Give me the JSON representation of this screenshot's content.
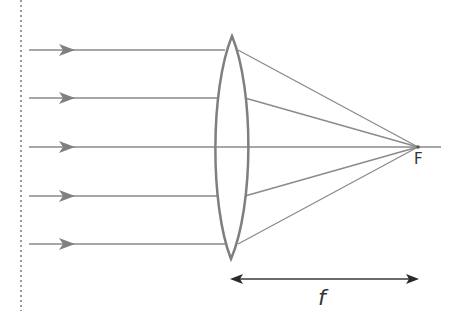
{
  "diagram": {
    "type": "optics-ray-diagram",
    "colors": {
      "ray": "#8a8a8a",
      "lens": "#7f7f7f",
      "arrow": "#3a3a3a",
      "dotted": "#9a9a9a",
      "text": "#333333"
    },
    "labels": {
      "focal_point": "F",
      "focal_length": "f"
    },
    "incoming_rays": [
      {
        "y": 50
      },
      {
        "y": 98
      },
      {
        "y": 147
      },
      {
        "y": 196
      },
      {
        "y": 244
      }
    ],
    "lens": {
      "center_x": 232,
      "top_y": 36,
      "bottom_y": 259,
      "half_width": 15
    },
    "focal_point": {
      "x": 418,
      "y": 147
    },
    "focal_length_arrow": {
      "x1": 231,
      "x2": 418,
      "y": 279
    }
  }
}
